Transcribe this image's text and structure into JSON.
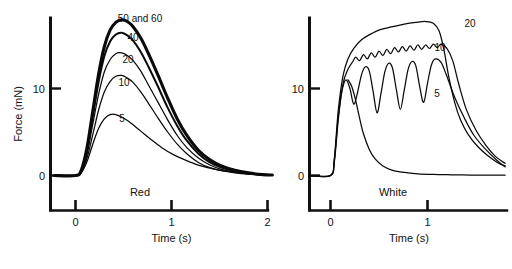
{
  "figure": {
    "panels": [
      {
        "key": "red",
        "label": "Red",
        "x_axis_title": "Time (s)",
        "y_axis_title": "Force (mN)",
        "x_ticks": [
          "0",
          "1",
          "2"
        ],
        "y_ticks": [
          "0",
          "10"
        ],
        "series_labels": [
          "50 and 60",
          "40",
          "20",
          "10",
          "5"
        ]
      },
      {
        "key": "white",
        "label": "White",
        "x_axis_title": "Time (s)",
        "x_ticks": [
          "0",
          "1"
        ],
        "y_ticks": [
          "0",
          "10"
        ],
        "series_labels": [
          "20",
          "10",
          "5"
        ]
      }
    ]
  },
  "chart_data": [
    {
      "type": "line",
      "title": "Red",
      "xlabel": "Time (s)",
      "ylabel": "Force (mN)",
      "xlim": [
        -0.25,
        2.1
      ],
      "ylim": [
        -1.2,
        19.5
      ],
      "xticks": [
        0,
        1,
        2
      ],
      "yticks": [
        0,
        10
      ],
      "grid": false,
      "legend": "inline-curve-labels",
      "series": [
        {
          "name": "50 and 60",
          "stimulus_frequency_hz": [
            50,
            60
          ],
          "linewidth": "thick",
          "x": [
            -0.22,
            0.0,
            0.06,
            0.12,
            0.18,
            0.24,
            0.3,
            0.36,
            0.42,
            0.48,
            0.54,
            0.6,
            0.68,
            0.76,
            0.86,
            0.96,
            1.06,
            1.16,
            1.28,
            1.4,
            1.52,
            1.66,
            1.8,
            1.95,
            2.05
          ],
          "y": [
            0.0,
            0.0,
            0.6,
            3.2,
            7.4,
            11.6,
            14.8,
            16.7,
            17.6,
            17.9,
            17.7,
            17.1,
            15.8,
            14.0,
            11.5,
            8.9,
            6.5,
            4.6,
            2.9,
            1.8,
            1.1,
            0.6,
            0.3,
            0.1,
            0.05
          ]
        },
        {
          "name": "40",
          "stimulus_frequency_hz": 40,
          "linewidth": "medium",
          "x": [
            -0.22,
            0.0,
            0.06,
            0.12,
            0.18,
            0.24,
            0.3,
            0.36,
            0.42,
            0.48,
            0.54,
            0.6,
            0.68,
            0.76,
            0.86,
            0.96,
            1.06,
            1.16,
            1.28,
            1.4,
            1.52,
            1.66,
            1.8,
            1.95,
            2.05
          ],
          "y": [
            0.0,
            0.0,
            0.5,
            2.9,
            6.8,
            10.7,
            13.7,
            15.4,
            16.2,
            16.4,
            16.1,
            15.5,
            14.2,
            12.5,
            10.2,
            7.8,
            5.7,
            4.0,
            2.5,
            1.5,
            0.9,
            0.5,
            0.25,
            0.1,
            0.05
          ]
        },
        {
          "name": "20",
          "stimulus_frequency_hz": 20,
          "linewidth": "thin",
          "x": [
            -0.22,
            0.0,
            0.06,
            0.12,
            0.18,
            0.24,
            0.3,
            0.36,
            0.42,
            0.48,
            0.54,
            0.6,
            0.68,
            0.76,
            0.86,
            0.96,
            1.06,
            1.16,
            1.28,
            1.4,
            1.52,
            1.66,
            1.8,
            1.95,
            2.05
          ],
          "y": [
            0.0,
            0.0,
            0.4,
            2.5,
            5.9,
            9.3,
            11.9,
            13.3,
            14.0,
            14.1,
            13.8,
            13.2,
            12.0,
            10.4,
            8.4,
            6.4,
            4.6,
            3.2,
            2.0,
            1.2,
            0.7,
            0.4,
            0.2,
            0.08,
            0.04
          ]
        },
        {
          "name": "10",
          "stimulus_frequency_hz": 10,
          "linewidth": "thin",
          "x": [
            -0.22,
            0.0,
            0.06,
            0.12,
            0.18,
            0.24,
            0.3,
            0.36,
            0.42,
            0.48,
            0.54,
            0.6,
            0.68,
            0.76,
            0.86,
            0.96,
            1.06,
            1.16,
            1.28,
            1.4,
            1.52,
            1.66,
            1.8,
            1.95,
            2.05
          ],
          "y": [
            0.0,
            0.0,
            0.35,
            2.0,
            4.7,
            7.5,
            9.6,
            10.8,
            11.4,
            11.5,
            11.2,
            10.7,
            9.6,
            8.3,
            6.6,
            5.0,
            3.6,
            2.5,
            1.5,
            0.9,
            0.55,
            0.3,
            0.15,
            0.06,
            0.03
          ]
        },
        {
          "name": "5",
          "stimulus_frequency_hz": 5,
          "linewidth": "thin",
          "x": [
            -0.22,
            0.0,
            0.06,
            0.12,
            0.18,
            0.24,
            0.3,
            0.36,
            0.42,
            0.5,
            0.58,
            0.68,
            0.78,
            0.9,
            1.02,
            1.14,
            1.28,
            1.42,
            1.56,
            1.72,
            1.88,
            2.05
          ],
          "y": [
            0.0,
            0.0,
            0.3,
            1.6,
            3.6,
            5.4,
            6.5,
            7.0,
            7.0,
            6.6,
            6.0,
            5.1,
            4.2,
            3.2,
            2.4,
            1.8,
            1.2,
            0.8,
            0.5,
            0.3,
            0.12,
            0.05
          ]
        }
      ]
    },
    {
      "type": "line",
      "title": "White",
      "xlabel": "Time (s)",
      "ylabel": "Force (mN)",
      "xlim": [
        -0.25,
        1.85
      ],
      "ylim": [
        -1.2,
        19.5
      ],
      "xticks": [
        0,
        1
      ],
      "yticks": [
        0,
        10
      ],
      "grid": false,
      "legend": "inline-curve-labels",
      "series": [
        {
          "name": "20",
          "stimulus_frequency_hz": 20,
          "linewidth": "thin",
          "note": "smooth fused tetanus, highest plateau",
          "x": [
            -0.22,
            0.0,
            0.04,
            0.08,
            0.13,
            0.18,
            0.24,
            0.32,
            0.42,
            0.52,
            0.64,
            0.76,
            0.88,
            0.98,
            1.06,
            1.12,
            1.17,
            1.22,
            1.28,
            1.34,
            1.42,
            1.52,
            1.62,
            1.72,
            1.8
          ],
          "y": [
            0.0,
            0.0,
            2.0,
            7.5,
            11.5,
            13.4,
            14.6,
            15.6,
            16.3,
            16.8,
            17.1,
            17.4,
            17.6,
            17.7,
            17.5,
            16.6,
            14.4,
            11.3,
            8.4,
            6.4,
            4.7,
            3.3,
            2.3,
            1.5,
            1.1
          ]
        },
        {
          "name": "10",
          "stimulus_frequency_hz": 10,
          "linewidth": "thin",
          "note": "slightly rippled plateau (unfused at 10 Hz)",
          "x": [
            -0.22,
            0.0,
            0.04,
            0.08,
            0.13,
            0.18,
            0.23,
            0.26,
            0.3,
            0.34,
            0.38,
            0.42,
            0.46,
            0.5,
            0.54,
            0.58,
            0.62,
            0.66,
            0.7,
            0.74,
            0.78,
            0.82,
            0.86,
            0.9,
            0.94,
            0.98,
            1.02,
            1.06,
            1.1,
            1.14,
            1.2,
            1.26,
            1.32,
            1.4,
            1.5,
            1.6,
            1.7,
            1.8
          ],
          "y": [
            0.0,
            0.0,
            1.8,
            6.8,
            10.6,
            12.2,
            13.1,
            13.6,
            13.2,
            13.9,
            13.4,
            14.1,
            13.6,
            14.3,
            13.8,
            14.5,
            14.0,
            14.7,
            14.2,
            14.8,
            14.3,
            14.9,
            14.4,
            15.0,
            14.5,
            15.0,
            14.6,
            15.1,
            14.7,
            15.1,
            14.6,
            13.2,
            10.6,
            7.6,
            5.2,
            3.5,
            2.2,
            1.4
          ]
        },
        {
          "name": "5",
          "stimulus_frequency_hz": 5,
          "linewidth": "thin",
          "note": "unfused tetanus with deep valleys between twitches",
          "x": [
            -0.22,
            0.0,
            0.04,
            0.08,
            0.12,
            0.16,
            0.2,
            0.24,
            0.28,
            0.32,
            0.36,
            0.4,
            0.44,
            0.48,
            0.52,
            0.56,
            0.6,
            0.64,
            0.68,
            0.72,
            0.76,
            0.8,
            0.84,
            0.88,
            0.92,
            0.96,
            1.0,
            1.04,
            1.08,
            1.14,
            1.2,
            1.28,
            1.38,
            1.48,
            1.6,
            1.72,
            1.8
          ],
          "y": [
            0.0,
            0.0,
            1.6,
            6.4,
            9.8,
            11.0,
            10.0,
            8.2,
            9.6,
            11.6,
            12.5,
            12.0,
            9.6,
            7.2,
            9.4,
            11.9,
            12.9,
            12.3,
            9.8,
            7.6,
            9.8,
            12.2,
            13.1,
            12.6,
            10.2,
            8.4,
            10.6,
            12.7,
            13.4,
            13.0,
            11.4,
            9.0,
            6.6,
            4.6,
            3.0,
            1.7,
            1.0
          ]
        },
        {
          "name": "5-twitch-decay",
          "stimulus_frequency_hz": 5,
          "linewidth": "thin",
          "note": "single twitch relaxation branch falling to baseline",
          "x": [
            0.18,
            0.22,
            0.26,
            0.3,
            0.34,
            0.4,
            0.46,
            0.54,
            0.64,
            0.76,
            0.9,
            1.06,
            1.24,
            1.44,
            1.64,
            1.8
          ],
          "y": [
            11.0,
            10.2,
            8.6,
            6.6,
            4.8,
            3.0,
            1.9,
            1.1,
            0.6,
            0.35,
            0.2,
            0.12,
            0.08,
            0.05,
            0.04,
            0.03
          ]
        }
      ]
    }
  ]
}
